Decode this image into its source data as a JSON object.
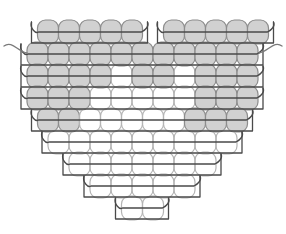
{
  "document": {
    "title": "Brick Stitch Heart Bead Pattern",
    "subject": "heart",
    "technique": "brick-stitch",
    "background_color": "#ffffff"
  },
  "style": {
    "bead_fill_shaded": "#c9c9c9",
    "bead_fill_plain": "#ffffff",
    "bead_outline_shaded": "#8c8c8c",
    "bead_outline_plain": "#b4b4b4",
    "thread_color": "#4a4a4a",
    "thread_color_light": "#7a7a7a",
    "bead_width": 21,
    "bead_height": 24,
    "bead_corner_radius": 8,
    "bead_outline_width": 1.2,
    "thread_width": 1.3
  },
  "grid": {
    "columns": 11,
    "rows": 9,
    "origin_x": 27,
    "origin_y": 20,
    "step_x": 21,
    "step_y": 22,
    "half_offset": 10.5,
    "description": "Offset brick-stitch grid; rows alternate half-bead indentation."
  },
  "rows": [
    {
      "index": 1,
      "label": "row-1-top-lobes",
      "y": 20,
      "segments": [
        {
          "name": "left-lobe",
          "start_col": 0.5,
          "count": 5,
          "fills": [
            "shaded",
            "shaded",
            "shaded",
            "shaded",
            "shaded"
          ]
        },
        {
          "name": "right-lobe",
          "start_col": 6.5,
          "count": 5,
          "fills": [
            "shaded",
            "shaded",
            "shaded",
            "shaded",
            "shaded"
          ]
        }
      ],
      "thread": [
        {
          "name": "thread-left-lobe",
          "start_col": 0.5,
          "count": 5,
          "tail_left": true,
          "tail_right": false
        },
        {
          "name": "thread-right-lobe",
          "start_col": 6.5,
          "count": 5,
          "tail_left": true,
          "tail_right": true
        }
      ]
    },
    {
      "index": 2,
      "label": "row-2",
      "y": 42,
      "segments": [
        {
          "name": "full-row",
          "start_col": 0,
          "count": 11,
          "fills": [
            "shaded",
            "shaded",
            "shaded",
            "shaded",
            "shaded",
            "shaded",
            "shaded",
            "shaded",
            "shaded",
            "shaded",
            "shaded"
          ]
        }
      ],
      "thread": [
        {
          "name": "thread-row-2",
          "start_col": 0,
          "count": 11,
          "tail_left": true,
          "tail_right": true
        }
      ]
    },
    {
      "index": 3,
      "label": "row-3",
      "y": 64,
      "segments": [
        {
          "name": "full-row",
          "start_col": 0,
          "count": 11,
          "fills": [
            "shaded",
            "shaded",
            "shaded",
            "shaded",
            "plain",
            "shaded",
            "shaded",
            "plain",
            "shaded",
            "shaded",
            "shaded"
          ]
        }
      ],
      "thread": [
        {
          "name": "thread-row-3",
          "start_col": 0,
          "count": 11,
          "tail_left": false,
          "tail_right": false
        }
      ]
    },
    {
      "index": 4,
      "label": "row-4",
      "y": 86,
      "segments": [
        {
          "name": "full-row",
          "start_col": 0,
          "count": 11,
          "fills": [
            "shaded",
            "shaded",
            "shaded",
            "plain",
            "plain",
            "plain",
            "plain",
            "plain",
            "shaded",
            "shaded",
            "shaded"
          ]
        }
      ],
      "thread": [
        {
          "name": "thread-row-4",
          "start_col": 0,
          "count": 11,
          "tail_left": false,
          "tail_right": false
        }
      ]
    },
    {
      "index": 5,
      "label": "row-5",
      "y": 108,
      "segments": [
        {
          "name": "full-row",
          "start_col": 0.5,
          "count": 10,
          "fills": [
            "shaded",
            "shaded",
            "plain",
            "plain",
            "plain",
            "plain",
            "plain",
            "shaded",
            "shaded",
            "shaded"
          ]
        }
      ],
      "thread": [
        {
          "name": "thread-row-5",
          "start_col": 0.5,
          "count": 10,
          "tail_left": false,
          "tail_right": false
        }
      ]
    },
    {
      "index": 6,
      "label": "row-6",
      "y": 130,
      "segments": [
        {
          "name": "full-row",
          "start_col": 1,
          "count": 9,
          "fills": [
            "plain",
            "plain",
            "plain",
            "plain",
            "plain",
            "plain",
            "plain",
            "plain",
            "plain"
          ]
        }
      ],
      "thread": [
        {
          "name": "thread-row-6",
          "start_col": 1,
          "count": 9,
          "tail_left": false,
          "tail_right": false
        }
      ]
    },
    {
      "index": 7,
      "label": "row-7",
      "y": 152,
      "segments": [
        {
          "name": "full-row",
          "start_col": 2,
          "count": 7,
          "fills": [
            "plain",
            "plain",
            "plain",
            "plain",
            "plain",
            "plain",
            "plain"
          ]
        }
      ],
      "thread": [
        {
          "name": "thread-row-7",
          "start_col": 2,
          "count": 7,
          "tail_left": false,
          "tail_right": false
        }
      ]
    },
    {
      "index": 8,
      "label": "row-8",
      "y": 174,
      "segments": [
        {
          "name": "full-row",
          "start_col": 3,
          "count": 5,
          "fills": [
            "plain",
            "plain",
            "plain",
            "plain",
            "plain"
          ]
        }
      ],
      "thread": [
        {
          "name": "thread-row-8",
          "start_col": 3,
          "count": 5,
          "tail_left": false,
          "tail_right": false
        }
      ]
    },
    {
      "index": 9,
      "label": "row-9-point",
      "y": 196,
      "segments": [
        {
          "name": "point",
          "start_col": 4.5,
          "count": 2,
          "fills": [
            "plain",
            "plain"
          ]
        }
      ],
      "thread": [
        {
          "name": "thread-row-9",
          "start_col": 4.5,
          "count": 2,
          "tail_left": false,
          "tail_right": false
        }
      ]
    }
  ],
  "thread_tails": {
    "left": {
      "name": "thread-tail-left",
      "path": "M 4 46 C 12 40, 18 52, 27 53"
    },
    "right": {
      "name": "thread-tail-right",
      "path": "M 282 46 C 274 40, 268 52, 259 53"
    }
  },
  "counts": {
    "total_beads": 63,
    "shaded_beads": 33,
    "plain_beads": 30,
    "row_bead_counts": [
      10,
      11,
      11,
      11,
      10,
      9,
      7,
      5,
      2
    ]
  }
}
